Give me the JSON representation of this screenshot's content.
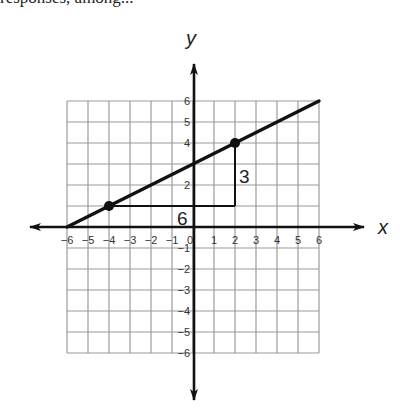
{
  "caption": "responses, among...",
  "chart_data": {
    "type": "line",
    "title": "",
    "xlabel": "x",
    "ylabel": "y",
    "xlim": [
      -6,
      6
    ],
    "ylim": [
      -6,
      6
    ],
    "grid": true,
    "x_ticks": [
      "-6",
      "-5",
      "-4",
      "-3",
      "-2",
      "-1",
      "0",
      "1",
      "2",
      "3",
      "4",
      "5",
      "6"
    ],
    "y_ticks": [
      "6",
      "5",
      "4",
      "2",
      "-1",
      "-2",
      "-3",
      "-4",
      "-5",
      "-6"
    ],
    "series": [
      {
        "name": "line",
        "x": [
          -6,
          6
        ],
        "y": [
          0,
          6
        ],
        "slope": 0.5,
        "intercept": 3
      }
    ],
    "points": [
      {
        "x": -4,
        "y": 1
      },
      {
        "x": 2,
        "y": 4
      }
    ],
    "annotations": [
      {
        "type": "run",
        "from": [
          -4,
          1
        ],
        "to": [
          2,
          1
        ],
        "label": "6"
      },
      {
        "type": "rise",
        "from": [
          2,
          1
        ],
        "to": [
          2,
          4
        ],
        "label": "3"
      }
    ]
  }
}
